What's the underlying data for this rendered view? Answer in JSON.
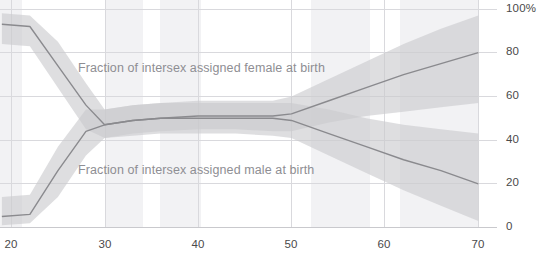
{
  "chart_data": {
    "type": "line",
    "title": "",
    "subtitle": "",
    "xlabel": "",
    "ylabel": "",
    "xlim": [
      18.8,
      72.0
    ],
    "ylim": [
      -1.5,
      102.0
    ],
    "grid": true,
    "legend_position": "inline-annotation",
    "xticks": [
      20,
      30,
      40,
      50,
      60,
      70
    ],
    "xticklabels": [
      "20",
      "30",
      "40",
      "50",
      "60",
      "70"
    ],
    "yticks": [
      0,
      20,
      40,
      60,
      80,
      100
    ],
    "yticklabels": [
      "0",
      "20",
      "40",
      "60",
      "80",
      "100%"
    ],
    "y_axis_side": "right",
    "x": [
      19,
      22,
      25,
      28,
      30,
      33,
      36,
      40,
      44,
      48,
      50,
      54,
      58,
      62,
      66,
      70
    ],
    "series": [
      {
        "name": "Fraction of intersex assigned female at birth",
        "color": "#8a8a8e",
        "band_color": "#c9c9cd",
        "values": [
          93,
          92,
          74,
          56,
          47,
          49,
          50,
          51,
          51,
          51,
          52,
          58,
          64,
          70,
          75,
          80
        ],
        "band_low": [
          84,
          83,
          64,
          45,
          41,
          43,
          44,
          45,
          45,
          44,
          44,
          48,
          51,
          53,
          55,
          57
        ],
        "band_high": [
          98,
          97,
          85,
          66,
          54,
          56,
          57,
          58,
          58,
          58,
          60,
          68,
          76,
          84,
          91,
          97
        ]
      },
      {
        "name": "Fraction of intersex assigned male at birth",
        "color": "#8a8a8e",
        "band_color": "#c9c9cd",
        "values": [
          5,
          6,
          26,
          44,
          47,
          49,
          50,
          50,
          50,
          50,
          49,
          43,
          37,
          31,
          26,
          20
        ],
        "band_low": [
          1,
          2,
          14,
          33,
          41,
          42,
          43,
          43,
          43,
          42,
          41,
          33,
          25,
          17,
          10,
          3
        ],
        "band_high": [
          14,
          15,
          37,
          54,
          54,
          56,
          57,
          57,
          57,
          57,
          57,
          54,
          50,
          47,
          45,
          43
        ]
      }
    ],
    "annotations": [
      {
        "text": "Fraction of intersex assigned female at birth",
        "x_px": 78,
        "y_px": 61,
        "color": "#8e8e93"
      },
      {
        "text": "Fraction of intersex assigned male at birth",
        "x_px": 78,
        "y_px": 163,
        "color": "#8e8e93"
      }
    ],
    "background_bands": [
      {
        "x_start_px": 0,
        "x_end_px": 22
      },
      {
        "x_start_px": 105,
        "x_end_px": 143
      },
      {
        "x_start_px": 160,
        "x_end_px": 201
      },
      {
        "x_start_px": 311,
        "x_end_px": 370
      },
      {
        "x_start_px": 400,
        "x_end_px": 478
      }
    ],
    "colors": {
      "line": "#8a8a8e",
      "band": "#c9c9cd",
      "grid": "#d9d9dd",
      "axis_text": "#4a4a4a",
      "annotation_text": "#8e8e93",
      "background_band": "#f2f2f4",
      "plot_background": "#ffffff"
    }
  },
  "axes": {
    "x_ticks": [
      {
        "label": "20",
        "px": 11
      },
      {
        "label": "30",
        "px": 105
      },
      {
        "label": "40",
        "px": 198
      },
      {
        "label": "50",
        "px": 291
      },
      {
        "label": "60",
        "px": 384
      },
      {
        "label": "70",
        "px": 478
      }
    ],
    "y_ticks": [
      {
        "label": "100%",
        "px": 9
      },
      {
        "label": "80",
        "px": 52
      },
      {
        "label": "60",
        "px": 96
      },
      {
        "label": "40",
        "px": 140
      },
      {
        "label": "20",
        "px": 183
      },
      {
        "label": "0",
        "px": 227
      }
    ]
  }
}
